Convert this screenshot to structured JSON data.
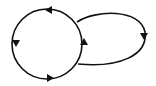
{
  "diagram": {
    "type": "cycle-with-loop",
    "stroke_color": "#111111",
    "background": "#ffffff",
    "circle": {
      "cx": 47,
      "cy": 44,
      "r": 35,
      "direction": "counterclockwise"
    },
    "loop": {
      "direction": "clockwise",
      "rightmost_x": 145
    },
    "arrows": [
      {
        "position": "circle-top",
        "direction": "left"
      },
      {
        "position": "circle-left",
        "direction": "down"
      },
      {
        "position": "circle-bottom",
        "direction": "right"
      },
      {
        "position": "circle-right",
        "direction": "up"
      },
      {
        "position": "loop-right",
        "direction": "down"
      }
    ]
  }
}
